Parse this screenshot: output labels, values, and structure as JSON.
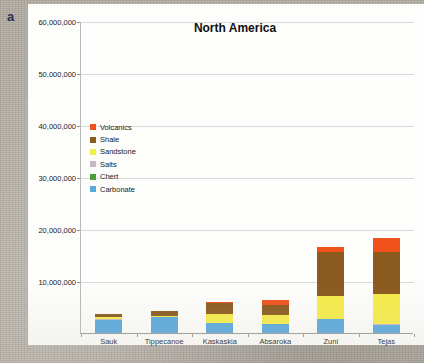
{
  "figure": {
    "panel_label": "a",
    "background_color": "#b3ada3",
    "panel_color": "#fdfdfb"
  },
  "chart_data": {
    "type": "bar",
    "subtype": "stacked-vertical",
    "title": "North America",
    "xlabel": "",
    "ylabel": "",
    "grid": true,
    "legend_position": "inside-upper-left",
    "ylim": [
      0,
      60000000
    ],
    "yticks": [
      0,
      10000000,
      20000000,
      30000000,
      40000000,
      50000000,
      60000000
    ],
    "ytick_labels": [
      "",
      "10,000,000",
      "20,000,000",
      "30,000,000",
      "40,000,000",
      "50,000,000",
      "60,000,000"
    ],
    "categories": [
      "Sauk",
      "Tippecanoe",
      "Kaskaskia",
      "Absaroka",
      "Zuni",
      "Tejas"
    ],
    "series": [
      {
        "name": "Carbonate",
        "color": "#59a9dd",
        "values": [
          2500000,
          3000000,
          1900000,
          1700000,
          2600000,
          1600000
        ]
      },
      {
        "name": "Chert",
        "color": "#4f9c3f",
        "values": [
          0,
          0,
          0,
          0,
          0,
          0
        ]
      },
      {
        "name": "Salts",
        "color": "#c9b7c4",
        "values": [
          100000,
          100000,
          100000,
          100000,
          100000,
          100000
        ]
      },
      {
        "name": "Sandstone",
        "color": "#f6ec4a",
        "values": [
          400000,
          200000,
          1700000,
          1600000,
          4500000,
          5800000
        ]
      },
      {
        "name": "Shale",
        "color": "#8a5a1e",
        "values": [
          600000,
          900000,
          2100000,
          2000000,
          8400000,
          8100000
        ]
      },
      {
        "name": "Volcanics",
        "color": "#f1511b",
        "values": [
          100000,
          100000,
          100000,
          1000000,
          1000000,
          2600000
        ]
      }
    ],
    "totals": [
      3700000,
      4300000,
      5900000,
      6400000,
      16600000,
      18200000
    ]
  },
  "legend": {
    "items": [
      {
        "label": "Volcanics",
        "color": "#f1511b"
      },
      {
        "label": "Shale",
        "color": "#8a5a1e"
      },
      {
        "label": "Sandstone",
        "color": "#f6ec4a"
      },
      {
        "label": "Salts",
        "color": "#c9b7c4"
      },
      {
        "label": "Chert",
        "color": "#4f9c3f"
      },
      {
        "label": "Carbonate",
        "color": "#59a9dd"
      }
    ]
  }
}
